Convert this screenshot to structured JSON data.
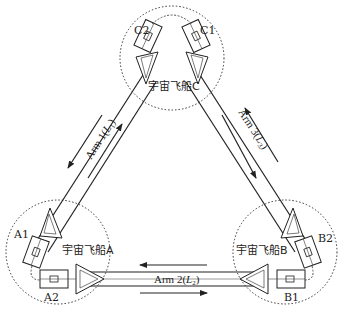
{
  "spacecraft": {
    "A": {
      "label": "宇宙飞船A",
      "port1": "A1",
      "port2": "A2"
    },
    "B": {
      "label": "宇宙飞船B",
      "port1": "B1",
      "port2": "B2"
    },
    "C": {
      "label": "宇宙飞船C",
      "port1": "C1",
      "port2": "C2"
    }
  },
  "arms": {
    "arm1": {
      "label": "Arm 1(L1)",
      "text": "Arm 1(",
      "sym": "L",
      "sub": "1",
      "close": ")"
    },
    "arm2": {
      "label": "Arm 2(L2)",
      "text": "Arm 2(",
      "sym": "L",
      "sub": "2",
      "close": ")"
    },
    "arm3": {
      "label": "Arm 3(L3)",
      "text": "Arm 3(",
      "sym": "L",
      "sub": "3",
      "close": ")"
    }
  },
  "colors": {
    "line": "#222222",
    "dotted": "#333333",
    "background": "#ffffff"
  }
}
